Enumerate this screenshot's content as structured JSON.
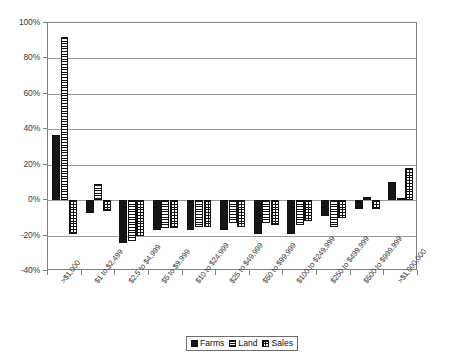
{
  "chart_data": {
    "type": "bar",
    "title": "",
    "xlabel": "",
    "ylabel": "",
    "ylim": [
      -40,
      100
    ],
    "ytick_labels": [
      "100%",
      "80%",
      "60%",
      "40%",
      "20%",
      "0%",
      "-20%",
      "-40%"
    ],
    "ytick_values": [
      100,
      80,
      60,
      40,
      20,
      0,
      -20,
      -40
    ],
    "grid": true,
    "legend_position": "bottom",
    "categories": [
      ">$1,000",
      "$1 to $2,499",
      "$2,5 to $4,999",
      "$5 to $9,999",
      "$10 to $24,999",
      "$25 to $49,999",
      "$50 to $99,999",
      "$100 to $249,999",
      "$250 to $499,999",
      "$500 to $999,999",
      ">$1,000,000"
    ],
    "series": [
      {
        "name": "Farms",
        "pattern": "solid",
        "values": [
          37,
          -7,
          -24,
          -17,
          -17,
          -17,
          -19,
          -19,
          -9,
          -5,
          10
        ]
      },
      {
        "name": "Land",
        "pattern": "horizontal",
        "values": [
          92,
          9,
          -23,
          -16,
          -15,
          -13,
          -13,
          -14,
          -15,
          2,
          1
        ]
      },
      {
        "name": "Sales",
        "pattern": "grid",
        "values": [
          -19,
          -6,
          -20,
          -16,
          -15,
          -15,
          -14,
          -12,
          -10,
          -5,
          18
        ]
      }
    ]
  },
  "legend": {
    "items": [
      {
        "label": "Farms"
      },
      {
        "label": "Land"
      },
      {
        "label": "Sales"
      }
    ]
  }
}
